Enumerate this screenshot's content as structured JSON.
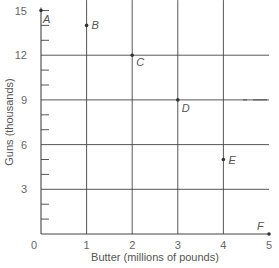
{
  "chart_data": {
    "type": "scatter",
    "title": "",
    "xlabel": "Butter (millions of pounds)",
    "ylabel": "Guns (thousands)",
    "xlim": [
      0,
      5
    ],
    "ylim": [
      0,
      15
    ],
    "x_ticks": [
      "0",
      "1",
      "2",
      "3",
      "4",
      "5"
    ],
    "y_ticks": [
      "3",
      "6",
      "9",
      "12",
      "15"
    ],
    "grid": true,
    "points": [
      {
        "label": "A",
        "x": 0,
        "y": 15
      },
      {
        "label": "B",
        "x": 1,
        "y": 14
      },
      {
        "label": "C",
        "x": 2,
        "y": 12
      },
      {
        "label": "D",
        "x": 3,
        "y": 9
      },
      {
        "label": "E",
        "x": 4,
        "y": 5
      },
      {
        "label": "F",
        "x": 5,
        "y": 0
      }
    ]
  },
  "colors": {
    "grid": "#444444",
    "point": "#333333",
    "text": "#666666"
  }
}
